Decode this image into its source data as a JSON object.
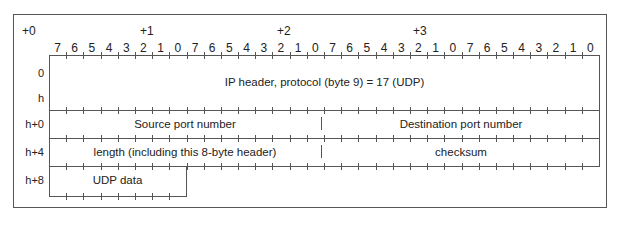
{
  "byte_offsets": [
    "+0",
    "+1",
    "+2",
    "+3"
  ],
  "bit_labels": [
    "7",
    "6",
    "5",
    "4",
    "3",
    "2",
    "1",
    "0",
    "7",
    "6",
    "5",
    "4",
    "3",
    "2",
    "1",
    "0",
    "7",
    "6",
    "5",
    "4",
    "3",
    "2",
    "1",
    "0",
    "7",
    "6",
    "5",
    "4",
    "3",
    "2",
    "1",
    "0"
  ],
  "row_labels": {
    "r0": "0",
    "rh": "h",
    "rh0": "h+0",
    "rh4": "h+4",
    "rh8": "h+8"
  },
  "fields": {
    "ip_header": "IP header, protocol (byte 9) = 17 (UDP)",
    "source_port": "Source port number",
    "destination_port": "Destination port number",
    "length": "length (including this 8-byte header)",
    "checksum": "checksum",
    "udp_data": "UDP data"
  }
}
